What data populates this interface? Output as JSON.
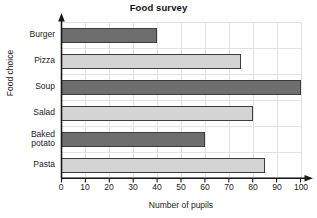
{
  "chart_data": {
    "type": "bar",
    "orientation": "horizontal",
    "title": "Food survey",
    "xlabel": "Number of pupils",
    "ylabel": "Food choice",
    "categories": [
      "Burger",
      "Pizza",
      "Soup",
      "Salad",
      "Baked potato",
      "Pasta"
    ],
    "values": [
      40,
      75,
      100,
      80,
      60,
      85
    ],
    "xlim": [
      0,
      100
    ],
    "xticks": [
      0,
      10,
      20,
      30,
      40,
      50,
      60,
      70,
      80,
      90,
      100
    ],
    "xtick_labels": [
      "0",
      "10",
      "20",
      "30",
      "40",
      "50",
      "60",
      "70",
      "80",
      "90",
      "100"
    ],
    "grid": true,
    "legend": null,
    "bar_colors": [
      "#6e6e6e",
      "#d4d4d4",
      "#6e6e6e",
      "#d4d4d4",
      "#6e6e6e",
      "#d4d4d4"
    ],
    "bar_edge_color": "#3d3d3d",
    "grid_color": "#e2e2e2",
    "axis_color": "#1a1a1a",
    "background": "#ffffff"
  },
  "bars": [
    {
      "label": "Burger",
      "label_display": "Burger",
      "value": 40,
      "color": "#6e6e6e"
    },
    {
      "label": "Pizza",
      "label_display": "Pizza",
      "value": 75,
      "color": "#d4d4d4"
    },
    {
      "label": "Soup",
      "label_display": "Soup",
      "value": 100,
      "color": "#6e6e6e"
    },
    {
      "label": "Salad",
      "label_display": "Salad",
      "value": 80,
      "color": "#d4d4d4"
    },
    {
      "label": "Baked potato",
      "label_display": "Baked\npotato",
      "value": 60,
      "color": "#6e6e6e"
    },
    {
      "label": "Pasta",
      "label_display": "Pasta",
      "value": 85,
      "color": "#d4d4d4"
    }
  ]
}
